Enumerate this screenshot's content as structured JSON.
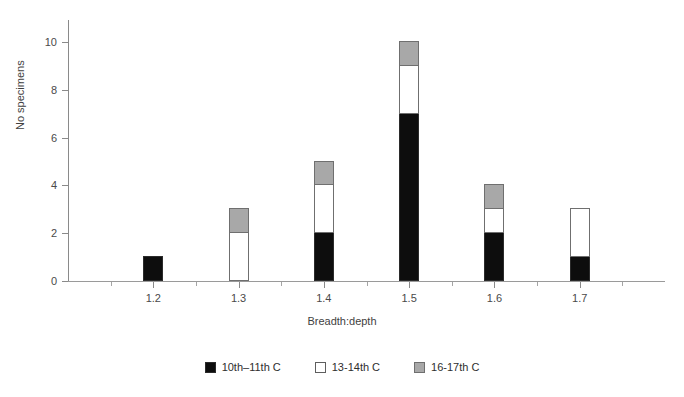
{
  "chart_data": {
    "type": "bar",
    "subtype": "stacked-bar",
    "title": "",
    "xlabel": "Breadth:depth",
    "ylabel": "No specimens",
    "categories": [
      "1.2",
      "1.3",
      "1.4",
      "1.5",
      "1.6",
      "1.7"
    ],
    "series": [
      {
        "name": "10th–11th C",
        "color": "#0d0d0d",
        "values": [
          1,
          0,
          2,
          7,
          2,
          1
        ]
      },
      {
        "name": "13-14th C",
        "color": "#ffffff",
        "values": [
          0,
          2,
          2,
          2,
          1,
          2
        ]
      },
      {
        "name": "16-17th C",
        "color": "#a8a8a8",
        "values": [
          0,
          1,
          1,
          1,
          1,
          0
        ]
      }
    ],
    "totals": [
      1,
      3,
      5,
      10,
      4,
      3
    ],
    "ylim": [
      0,
      11
    ],
    "ytick_labels": [
      "0",
      "2",
      "4",
      "6",
      "8",
      "10"
    ],
    "ytick_values": [
      0,
      2,
      4,
      6,
      8,
      10
    ],
    "grid": false,
    "legend_position": "bottom"
  },
  "axes": {
    "y_title": "No specimens",
    "x_title": "Breadth:depth"
  },
  "legend": {
    "items": [
      {
        "label": "10th–11th C",
        "swatch": "black-swatch-icon"
      },
      {
        "label": "13-14th C",
        "swatch": "white-swatch-icon"
      },
      {
        "label": "16-17th C",
        "swatch": "gray-swatch-icon"
      }
    ]
  },
  "colors": {
    "series_black": "#0d0d0d",
    "series_white": "#ffffff",
    "series_gray": "#a8a8a8",
    "axis": "#8a8a8a",
    "text": "#3a3a3a",
    "background": "#ffffff"
  }
}
